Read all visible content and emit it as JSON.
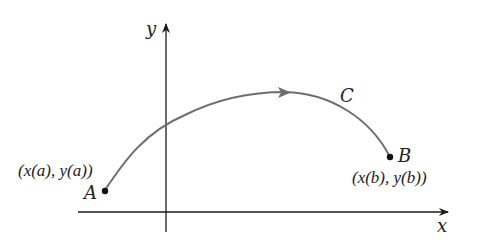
{
  "diagram": {
    "axes": {
      "x_label": "x",
      "y_label": "y"
    },
    "curve": {
      "label": "C",
      "color": "#6e6e6e",
      "direction": "A to B"
    },
    "points": {
      "A": {
        "label": "A",
        "coord_label": "(x(a), y(a))"
      },
      "B": {
        "label": "B",
        "coord_label": "(x(b), y(b))"
      }
    },
    "colors": {
      "axis": "#1a1a1a",
      "curve": "#6e6e6e",
      "point": "#111111",
      "text": "#222222"
    }
  }
}
